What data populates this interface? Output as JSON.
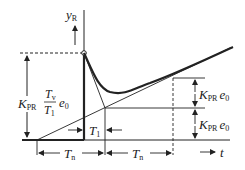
{
  "diagram": {
    "axis_y_label": "y",
    "axis_y_sub": "R",
    "axis_x_label": "t",
    "labels": {
      "left_K": "K",
      "left_K_sub": "PR",
      "left_frac_num": "T",
      "left_frac_num_sub": "v",
      "left_frac_den": "T",
      "left_frac_den_sub": "1",
      "left_e": "e",
      "left_e_sub": "0",
      "right_upper_K": "K",
      "right_upper_K_sub": "PR",
      "right_upper_e": "e",
      "right_upper_e_sub": "0",
      "right_lower_K": "K",
      "right_lower_K_sub": "PR",
      "right_lower_e": "e",
      "right_lower_e_sub": "0",
      "T1": "T",
      "T1_sub": "1",
      "Tn_left": "T",
      "Tn_left_sub": "n",
      "Tn_right": "T",
      "Tn_right_sub": "n"
    }
  }
}
